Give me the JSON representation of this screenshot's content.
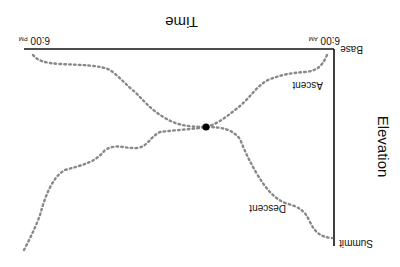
{
  "diagram": {
    "orientation": "rotated-180",
    "x_axis": {
      "title": "Time",
      "start_label": "6:00",
      "start_suffix": "AM",
      "end_label": "6:00",
      "end_suffix": "PM"
    },
    "y_axis": {
      "title": "Elevation",
      "bottom_label": "Base",
      "top_label": "Summit"
    },
    "series": [
      {
        "name": "Ascent",
        "style": "dotted",
        "color": "#888888"
      },
      {
        "name": "Descent",
        "style": "dotted",
        "color": "#888888"
      }
    ],
    "intersection_marker": {
      "color": "#000000"
    }
  }
}
